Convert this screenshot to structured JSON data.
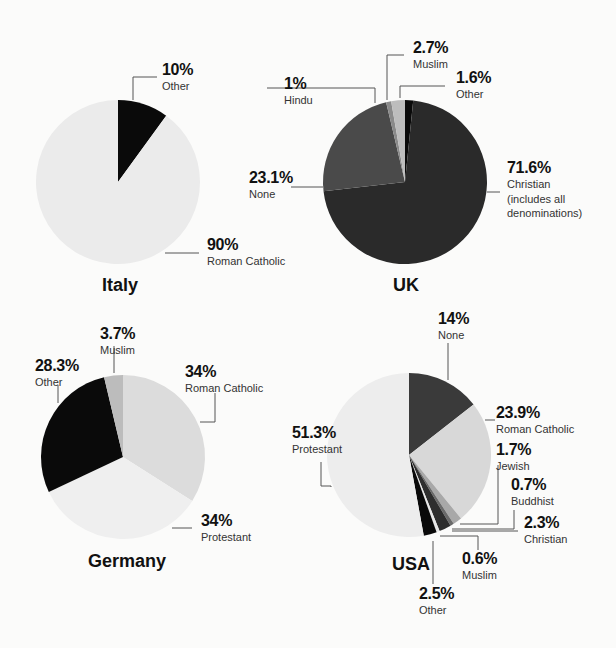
{
  "chart_data": [
    {
      "type": "pie",
      "title": "Italy",
      "categories": [
        "Other",
        "Roman Catholic"
      ],
      "values": [
        10,
        90
      ],
      "labels": [
        "10%",
        "90%"
      ],
      "colors": [
        "#0a0a0a",
        "#ebebeb"
      ]
    },
    {
      "type": "pie",
      "title": "UK",
      "categories": [
        "Other",
        "Christian (includes all denominations)",
        "None",
        "Hindu",
        "Muslim"
      ],
      "values": [
        1.6,
        71.6,
        23.1,
        1,
        2.7
      ],
      "labels": [
        "1.6%",
        "71.6%",
        "23.1%",
        "1%",
        "2.7%"
      ],
      "colors": [
        "#0a0a0a",
        "#2a2a2a",
        "#4a4a4a",
        "#8a8a8a",
        "#bdbdbd"
      ]
    },
    {
      "type": "pie",
      "title": "Germany",
      "categories": [
        "Roman Catholic",
        "Protestant",
        "Other",
        "Muslim"
      ],
      "values": [
        34,
        34,
        28.3,
        3.7
      ],
      "labels": [
        "34%",
        "34%",
        "28.3%",
        "3.7%"
      ],
      "colors": [
        "#dcdcdc",
        "#efefef",
        "#0a0a0a",
        "#bcbcbc"
      ]
    },
    {
      "type": "pie",
      "title": "USA",
      "categories": [
        "None",
        "Roman Catholic",
        "Jewish",
        "Buddhist",
        "Christian",
        "Muslim",
        "Other",
        "Protestant"
      ],
      "values": [
        14,
        23.9,
        1.7,
        0.7,
        2.3,
        0.6,
        2.5,
        51.3
      ],
      "labels": [
        "14%",
        "23.9%",
        "1.7%",
        "0.7%",
        "2.3%",
        "0.6%",
        "2.5%",
        "51.3%"
      ],
      "colors": [
        "#3a3a3a",
        "#d8d8d8",
        "#a8a8a8",
        "#6a6a6a",
        "#2e2e2e",
        "#e8e8e8",
        "#0a0a0a",
        "#ededed"
      ]
    }
  ],
  "italy": {
    "title": "Italy",
    "other": {
      "pct": "10%",
      "cat": "Other"
    },
    "catholic": {
      "pct": "90%",
      "cat": "Roman Catholic"
    }
  },
  "uk": {
    "title": "UK",
    "hindu": {
      "pct": "1%",
      "cat": "Hindu"
    },
    "muslim": {
      "pct": "2.7%",
      "cat": "Muslim"
    },
    "other": {
      "pct": "1.6%",
      "cat": "Other"
    },
    "none": {
      "pct": "23.1%",
      "cat": "None"
    },
    "christian": {
      "pct": "71.6%",
      "cat1": "Christian",
      "cat2": "(includes all",
      "cat3": "denominations)"
    }
  },
  "germany": {
    "title": "Germany",
    "muslim": {
      "pct": "3.7%",
      "cat": "Muslim"
    },
    "other": {
      "pct": "28.3%",
      "cat": "Other"
    },
    "catholic": {
      "pct": "34%",
      "cat": "Roman Catholic"
    },
    "protestant": {
      "pct": "34%",
      "cat": "Protestant"
    }
  },
  "usa": {
    "title": "USA",
    "none": {
      "pct": "14%",
      "cat": "None"
    },
    "catholic": {
      "pct": "23.9%",
      "cat": "Roman Catholic"
    },
    "jewish": {
      "pct": "1.7%",
      "cat": "Jewish"
    },
    "buddhist": {
      "pct": "0.7%",
      "cat": "Buddhist"
    },
    "christian": {
      "pct": "2.3%",
      "cat": "Christian"
    },
    "muslim": {
      "pct": "0.6%",
      "cat": "Muslim"
    },
    "other": {
      "pct": "2.5%",
      "cat": "Other"
    },
    "protestant": {
      "pct": "51.3%",
      "cat": "Protestant"
    }
  }
}
